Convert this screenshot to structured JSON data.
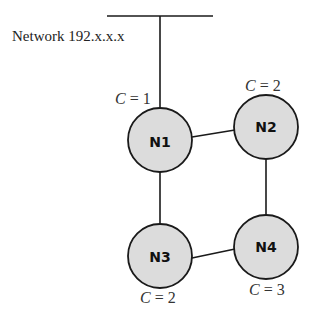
{
  "network": {
    "label": "Network 192.x.x.x"
  },
  "nodes": [
    {
      "id": "N1",
      "label": "N1",
      "cost_var": "C",
      "cost_eq": " = ",
      "cost_value": "1"
    },
    {
      "id": "N2",
      "label": "N2",
      "cost_var": "C",
      "cost_eq": " = ",
      "cost_value": "2"
    },
    {
      "id": "N3",
      "label": "N3",
      "cost_var": "C",
      "cost_eq": " = ",
      "cost_value": "2"
    },
    {
      "id": "N4",
      "label": "N4",
      "cost_var": "C",
      "cost_eq": " = ",
      "cost_value": "3"
    }
  ],
  "edges": [
    {
      "from": "network",
      "to": "N1"
    },
    {
      "from": "N1",
      "to": "N2"
    },
    {
      "from": "N1",
      "to": "N3"
    },
    {
      "from": "N2",
      "to": "N4"
    },
    {
      "from": "N3",
      "to": "N4"
    }
  ],
  "colors": {
    "node_fill": "#dcdcdc",
    "stroke": "#1a1a1a"
  }
}
